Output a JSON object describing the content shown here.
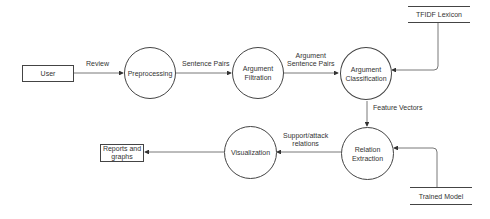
{
  "diagram": {
    "type": "data-flow-diagram",
    "external_entities": [
      {
        "id": "user",
        "label": "User"
      },
      {
        "id": "reports",
        "label": "Reports and graphs"
      }
    ],
    "processes": [
      {
        "id": "preprocessing",
        "label": "Preprocessing"
      },
      {
        "id": "filtration",
        "label": "Argument Filtration"
      },
      {
        "id": "classification",
        "label": "Argument Classification"
      },
      {
        "id": "relation",
        "label": "Relation Extraction"
      },
      {
        "id": "visualization",
        "label": "Visualization"
      }
    ],
    "data_stores": [
      {
        "id": "tfidf",
        "label": "TFIDF Lexicon"
      },
      {
        "id": "model",
        "label": "Trained Model"
      }
    ],
    "flows": [
      {
        "from": "user",
        "to": "preprocessing",
        "label": "Review"
      },
      {
        "from": "preprocessing",
        "to": "filtration",
        "label": "Sentence Pairs"
      },
      {
        "from": "filtration",
        "to": "classification",
        "label": "Argument Sentence Pairs"
      },
      {
        "from": "tfidf",
        "to": "classification",
        "label": ""
      },
      {
        "from": "classification",
        "to": "relation",
        "label": "Feature Vectors"
      },
      {
        "from": "model",
        "to": "relation",
        "label": ""
      },
      {
        "from": "relation",
        "to": "visualization",
        "label": "Support/attack relations"
      },
      {
        "from": "visualization",
        "to": "reports",
        "label": ""
      }
    ]
  },
  "labels": {
    "user": "User",
    "reports_line1": "Reports and",
    "reports_line2": "graphs",
    "preprocessing": "Preprocessing",
    "filtration_line1": "Argument",
    "filtration_line2": "Filtration",
    "classification_line1": "Argument",
    "classification_line2": "Classification",
    "relation_line1": "Relation",
    "relation_line2": "Extraction",
    "visualization": "Visualization",
    "tfidf": "TFIDF Lexicon",
    "model": "Trained Model",
    "flow_review": "Review",
    "flow_sentence_pairs": "Sentence Pairs",
    "flow_arg_pairs_line1": "Argument",
    "flow_arg_pairs_line2": "Sentence Pairs",
    "flow_feature_vectors": "Feature Vectors",
    "flow_support_line1": "Support/attack",
    "flow_support_line2": "relations"
  }
}
